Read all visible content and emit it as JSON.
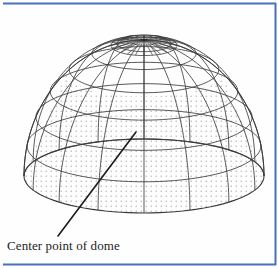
{
  "figure": {
    "kind": "technical-line-drawing",
    "subject": "dome",
    "background_color": "#fdfefd",
    "line_color": "#3b3b3b",
    "stipple_color": "#9a9a9a",
    "leader_color": "#1b1b1b"
  },
  "annotation": {
    "caption": "Center point of dome",
    "leader_from": {
      "x": 136,
      "y": 132
    },
    "leader_to": {
      "x": 58,
      "y": 236
    }
  },
  "borders": {
    "color": "#4a6fc0",
    "top": true,
    "right": true,
    "bottom": true,
    "left": false
  },
  "geometry": {
    "apex": {
      "x": 144,
      "y": 40
    },
    "center_x": 144,
    "base_center_y": 176,
    "radius_x": 120,
    "radius_y": 136,
    "base_ellipse_ry": 37,
    "meridian_count": 16,
    "latitude_count": 7,
    "hub_spokes": 24,
    "hub_radius_x": 22,
    "hub_radius_y": 7
  }
}
